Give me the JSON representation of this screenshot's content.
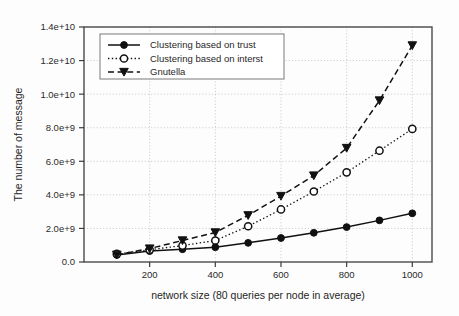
{
  "chart_data": {
    "type": "line",
    "title": "",
    "xlabel": "network size (80 queries per node in average)",
    "ylabel": "The number of message",
    "x": [
      100,
      200,
      300,
      400,
      500,
      600,
      700,
      800,
      900,
      1000
    ],
    "xlim": [
      0,
      1060
    ],
    "ylim": [
      0,
      14000000000
    ],
    "xticks": [
      200,
      400,
      600,
      800,
      1000
    ],
    "xtick_labels": [
      "200",
      "400",
      "600",
      "800",
      "1000"
    ],
    "yticks": [
      0,
      2000000000,
      4000000000,
      6000000000,
      8000000000,
      10000000000,
      12000000000,
      14000000000
    ],
    "ytick_labels": [
      "0.0",
      "2.0e+9",
      "4.0e+9",
      "6.0e+9",
      "8.0e+9",
      "1.0e+10",
      "1.2e+10",
      "1.4e+10"
    ],
    "grid": true,
    "grid_axis": "y",
    "legend_position": "upper left",
    "series": [
      {
        "name": "Clustering based on trust",
        "marker": "filled-circle",
        "linestyle": "solid",
        "color": "#111111",
        "values": [
          420000000,
          650000000,
          760000000,
          880000000,
          1140000000,
          1430000000,
          1740000000,
          2080000000,
          2480000000,
          2900000000
        ]
      },
      {
        "name": "Clustering based on interst",
        "marker": "open-circle",
        "linestyle": "dotted",
        "color": "#111111",
        "values": [
          480000000,
          730000000,
          980000000,
          1280000000,
          2130000000,
          3130000000,
          4200000000,
          5340000000,
          6630000000,
          7930000000
        ]
      },
      {
        "name": "Gnutella",
        "marker": "filled-triangle-down",
        "linestyle": "dashed",
        "color": "#111111",
        "values": [
          430000000,
          800000000,
          1280000000,
          1760000000,
          2780000000,
          3930000000,
          5150000000,
          6790000000,
          9620000000,
          12900000000
        ]
      }
    ]
  }
}
